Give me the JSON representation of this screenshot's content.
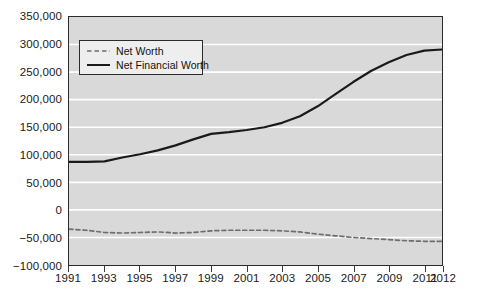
{
  "chart_data": {
    "type": "line",
    "title": "",
    "subtitle": "",
    "xlabel": "",
    "ylabel": "",
    "xlim": [
      1991,
      2012
    ],
    "ylim": [
      -100000,
      350000
    ],
    "grid": true,
    "legend_position": "top-left",
    "x": [
      1991,
      1992,
      1993,
      1994,
      1995,
      1996,
      1997,
      1998,
      1999,
      2000,
      2001,
      2002,
      2003,
      2004,
      2005,
      2006,
      2007,
      2008,
      2009,
      2010,
      2011,
      2012
    ],
    "y_ticks": [
      -100000,
      -50000,
      0,
      50000,
      100000,
      150000,
      200000,
      250000,
      300000,
      350000
    ],
    "y_tick_labels": [
      "−100,000",
      "−50,000",
      "0",
      "50,000",
      "100,000",
      "150,000",
      "200,000",
      "250,000",
      "300,000",
      "350,000"
    ],
    "x_ticks": [
      1991,
      1993,
      1995,
      1997,
      1999,
      2001,
      2003,
      2005,
      2007,
      2009,
      2011,
      2012
    ],
    "x_tick_labels": [
      "1991",
      "1993",
      "1995",
      "1997",
      "1999",
      "2001",
      "2003",
      "2005",
      "2007",
      "2009",
      "2011",
      "2012"
    ],
    "series": [
      {
        "name": "Net Worth",
        "style": "dashed",
        "color": "#6e6e6e",
        "values": [
          -35000,
          -37000,
          -41000,
          -42000,
          -41000,
          -40000,
          -42000,
          -41000,
          -38000,
          -37000,
          -37000,
          -37000,
          -38000,
          -40000,
          -44000,
          -47000,
          -50000,
          -52000,
          -54000,
          -56000,
          -57000,
          -57000
        ]
      },
      {
        "name": "Net Financial Worth",
        "style": "solid",
        "color": "#1a1a1a",
        "values": [
          87000,
          87000,
          88000,
          95000,
          101000,
          108000,
          117000,
          128000,
          138000,
          141000,
          145000,
          150000,
          158000,
          170000,
          188000,
          210000,
          232000,
          252000,
          268000,
          281000,
          289000,
          291000
        ]
      }
    ],
    "legend_entries": [
      {
        "label": "Net Worth",
        "style": "dashed",
        "color": "#6e6e6e"
      },
      {
        "label": "Net Financial Worth",
        "style": "solid",
        "color": "#1a1a1a"
      }
    ],
    "colors": {
      "plot_background": "#d9d9d9",
      "gridline": "#ffffff",
      "axis": "#2b2b2b",
      "page_background": "#ffffff",
      "legend_background": "#eeeeee"
    }
  }
}
